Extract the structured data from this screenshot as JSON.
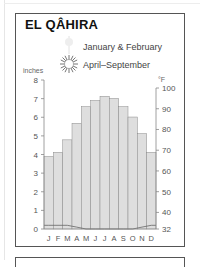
{
  "header": {
    "title": "EL QÂHIRA"
  },
  "legend": {
    "items": [
      {
        "label": "January & February",
        "icon": "faint-sun-icon"
      },
      {
        "label": "April–September",
        "icon": "sun-icon"
      }
    ]
  },
  "axes": {
    "left_unit": "inches",
    "right_unit": "°F",
    "left_ticks": [
      "0",
      "1",
      "2",
      "3",
      "4",
      "5",
      "6",
      "7",
      "8"
    ],
    "right_ticks": [
      "32",
      "40",
      "50",
      "60",
      "70",
      "80",
      "90",
      "100"
    ],
    "months": [
      "J",
      "F",
      "M",
      "A",
      "M",
      "J",
      "J",
      "A",
      "S",
      "O",
      "N",
      "D"
    ]
  },
  "colors": {
    "bar_fill": "#dedede",
    "bar_stroke": "#8a8a8a",
    "axis": "#888888",
    "frame": "#555555",
    "text": "#555555"
  },
  "chart_data": {
    "type": "bar",
    "title": "EL QÂHIRA",
    "categories": [
      "J",
      "F",
      "M",
      "A",
      "M",
      "J",
      "J",
      "A",
      "S",
      "O",
      "N",
      "D"
    ],
    "series": [
      {
        "name": "Average high temperature (°F)",
        "type": "bar",
        "axis": "right",
        "values": [
          67,
          69,
          75,
          83,
          91,
          94,
          96,
          95,
          91,
          86,
          78,
          69
        ]
      },
      {
        "name": "Precipitation (inches)",
        "type": "line",
        "axis": "left",
        "values": [
          0.2,
          0.2,
          0.2,
          0.1,
          0.0,
          0.0,
          0.0,
          0.0,
          0.0,
          0.0,
          0.1,
          0.2
        ]
      }
    ],
    "xlabel": "",
    "ylabel_left": "inches",
    "ylabel_right": "°F",
    "ylim_left": [
      0,
      8
    ],
    "ylim_right": [
      32,
      100
    ],
    "legend": [
      "January & February",
      "April–September"
    ],
    "grid": false
  }
}
